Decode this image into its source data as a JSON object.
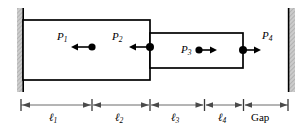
{
  "figure": {
    "type": "mechanical-schematic",
    "background_color": "#ffffff",
    "line_color": "#000000",
    "wall_fill_color": "#c8c8c8",
    "dimension_line_color": "#555555"
  },
  "walls": [
    {
      "id": "left-wall",
      "x": 17,
      "y": 8,
      "width": 6,
      "height": 84
    },
    {
      "id": "right-wall",
      "x": 289,
      "y": 8,
      "width": 6,
      "height": 84
    }
  ],
  "blocks": [
    {
      "id": "outer-block",
      "x": 23,
      "y": 20,
      "width": 127,
      "height": 60
    },
    {
      "id": "inner-block",
      "x": 150,
      "y": 33,
      "width": 93,
      "height": 35
    }
  ],
  "force_points": [
    {
      "label": "P",
      "subscript": "1",
      "label_x": 57,
      "label_y": 32,
      "dot_x": 92,
      "dot_y": 47,
      "arrow_dir": "left",
      "arrow_len": 20
    },
    {
      "label": "P",
      "subscript": "2",
      "label_x": 112,
      "label_y": 32,
      "dot_x": 150,
      "dot_y": 47,
      "arrow_dir": "left",
      "arrow_len": 20
    },
    {
      "label": "P",
      "subscript": "3",
      "label_x": 181,
      "label_y": 43,
      "dot_x": 199,
      "dot_y": 50,
      "arrow_dir": "right",
      "arrow_len": 18
    },
    {
      "label": "P",
      "subscript": "4",
      "label_x": 262,
      "label_y": 31,
      "dot_x": 243,
      "dot_y": 50,
      "arrow_dir": "right",
      "arrow_len": 19
    }
  ],
  "dimensions": {
    "baseline_y": 105,
    "label_y": 112,
    "segments": [
      {
        "label": "ℓ",
        "subscript": "1",
        "x_start": 21,
        "x_end": 91,
        "label_text": "ℓ"
      },
      {
        "label": "ℓ",
        "subscript": "2",
        "x_start": 93,
        "x_end": 149,
        "label_text": "ℓ"
      },
      {
        "label": "ℓ",
        "subscript": "3",
        "x_start": 151,
        "x_end": 203,
        "label_text": "ℓ"
      },
      {
        "label": "ℓ",
        "subscript": "4",
        "x_start": 206,
        "x_end": 242,
        "label_text": "ℓ"
      },
      {
        "label": "Gap",
        "subscript": "",
        "x_start": 245,
        "x_end": 289,
        "label_text": "Gap"
      }
    ]
  }
}
